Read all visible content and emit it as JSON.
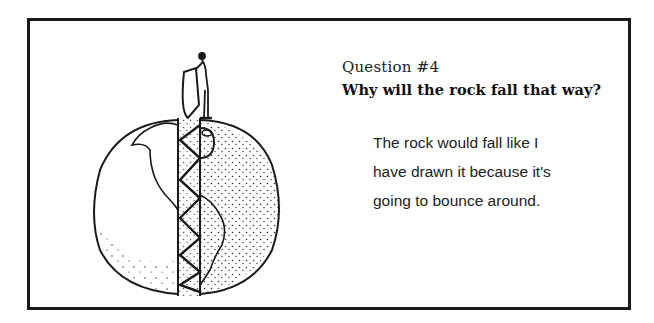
{
  "card": {
    "question_number": "Question #4",
    "question_text": "Why will the rock fall that way?",
    "answer_lines": [
      "The rock would fall like I",
      "have drawn it because it's",
      "going to bounce around."
    ]
  },
  "illustration": {
    "subject": "globe-cutaway-with-person-dropping-rock",
    "elements": [
      "person-figure",
      "rock",
      "globe",
      "tunnel-strip",
      "zigzag-path",
      "continents"
    ],
    "colors": {
      "ink": "#1a1a1a",
      "paper": "#ffffff"
    }
  }
}
